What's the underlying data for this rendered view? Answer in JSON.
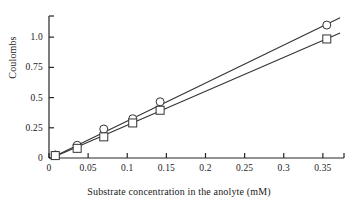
{
  "chart_data": {
    "type": "scatter",
    "title": "",
    "xlabel": "Substrate concentration in the anolyte (mM)",
    "ylabel": "Coulombs",
    "xlim": [
      0,
      0.377
    ],
    "ylim": [
      0,
      1.175
    ],
    "grid": false,
    "legend": "none",
    "xticks": [
      0,
      0.05,
      0.1,
      0.15,
      0.2,
      0.25,
      0.3,
      0.35
    ],
    "xticklabels": [
      "0",
      "0.05",
      "0.1",
      "0.15",
      "0.2",
      "0.25",
      "0.3",
      "0.35"
    ],
    "yticks": [
      0,
      0.25,
      0.5,
      0.75,
      1.0
    ],
    "yticklabels": [
      "0",
      "0.25",
      "0.5",
      "0.75",
      "1.0"
    ],
    "series": [
      {
        "name": "circle-series",
        "marker": "open-circle",
        "color": "#333333",
        "x": [
          0.008,
          0.036,
          0.07,
          0.107,
          0.142,
          0.355
        ],
        "y": [
          0.025,
          0.105,
          0.24,
          0.325,
          0.465,
          1.1
        ],
        "fit_line": {
          "x": [
            0.004,
            0.372
          ],
          "y": [
            0.005,
            1.16
          ],
          "slope": 3.14,
          "intercept": -0.0076
        }
      },
      {
        "name": "square-series",
        "marker": "open-square",
        "color": "#333333",
        "x": [
          0.008,
          0.036,
          0.07,
          0.107,
          0.142,
          0.355
        ],
        "y": [
          0.02,
          0.08,
          0.175,
          0.29,
          0.395,
          0.985
        ],
        "fit_line": {
          "x": [
            0.004,
            0.372
          ],
          "y": [
            0.002,
            1.035
          ],
          "slope": 2.81,
          "intercept": -0.0092
        }
      }
    ]
  },
  "axes": {
    "x_title": "Substrate concentration in the anolyte (mM)",
    "y_title": "Coulombs"
  }
}
